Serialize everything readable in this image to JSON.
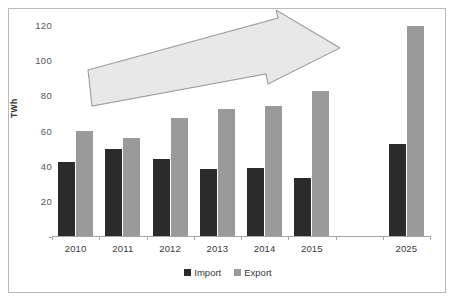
{
  "chart_data": {
    "type": "bar",
    "title": "",
    "subtitle": "",
    "xlabel": "",
    "ylabel": "TWh",
    "categories": [
      "2010",
      "2011",
      "2012",
      "2013",
      "2014",
      "2015",
      "2025"
    ],
    "series": [
      {
        "name": "Import",
        "color": "#2b2b2b",
        "values": [
          42,
          49.5,
          44,
          38,
          38.5,
          33,
          52.5
        ]
      },
      {
        "name": "Export",
        "color": "#9a9a9a",
        "values": [
          60,
          56,
          67,
          72,
          74,
          82.5,
          119.5
        ]
      }
    ],
    "ylim": [
      0,
      120
    ],
    "yticks": [
      "-",
      "20",
      "40",
      "60",
      "80",
      "100",
      "120"
    ],
    "ytick_values": [
      0,
      20,
      40,
      60,
      80,
      100,
      120
    ],
    "grid": false,
    "legend_position": "bottom",
    "annotations": [
      {
        "name": "growth-arrow",
        "type": "arrow",
        "description": "large light-gray block arrow sloping upward to the right across the plot",
        "fill": "#e8e8e8",
        "stroke": "#9e9e9e"
      }
    ],
    "note": "gap on x-axis between 2015 and 2025 category"
  },
  "axis": {
    "y_title": "TWh"
  },
  "legend": {
    "items": [
      {
        "label": "Import",
        "color": "#2b2b2b"
      },
      {
        "label": "Export",
        "color": "#9a9a9a"
      }
    ]
  },
  "colors": {
    "import": "#2b2b2b",
    "export": "#9a9a9a",
    "axis": "#a6a6a6",
    "frame": "#b9b9b9",
    "arrow_fill": "#e8e8e8",
    "arrow_stroke": "#9e9e9e",
    "background": "#ffffff"
  }
}
